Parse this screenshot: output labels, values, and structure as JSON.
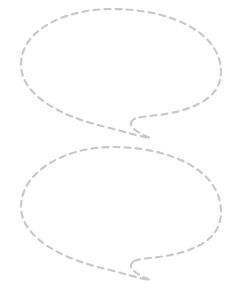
{
  "canvas": {
    "width": 242,
    "height": 297,
    "background": "#ffffff"
  },
  "style": {
    "stroke_color": "#c9c9c9",
    "stroke_width": 2.2,
    "dash": "6 5"
  },
  "bubbles": [
    {
      "name": "speech-bubble-top",
      "text": ""
    },
    {
      "name": "speech-bubble-bottom",
      "text": ""
    }
  ]
}
